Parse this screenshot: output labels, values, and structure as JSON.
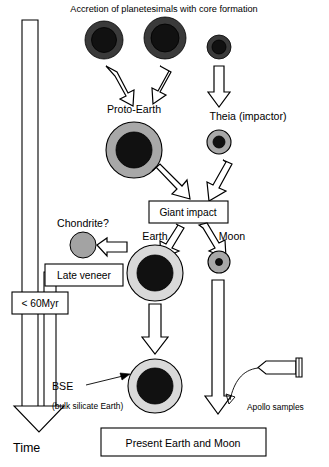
{
  "figure": {
    "title": "Accretion of planetesimals with core formation",
    "domain_note": "schematic of Earth-Moon formation"
  },
  "labels": {
    "proto_earth": "Proto-Earth",
    "theia": "Theia (impactor)",
    "giant_impact": "Giant impact",
    "chondrite": "Chondrite?",
    "late_veneer": "Late veneer",
    "earth": "Earth",
    "moon": "Moon",
    "timescale": "< 60Myr",
    "bse_abbr": "BSE",
    "bse_full": "(bulk silicate Earth)",
    "apollo": "Apollo samples",
    "time_axis": "Time",
    "present": "Present Earth and Moon"
  },
  "bodies": [
    {
      "name": "planetesimal-1",
      "cx": 104,
      "cy": 40,
      "shell_r": 19,
      "core_r": 12.5,
      "shell_color": "#3a3a3a",
      "core_color": "#111111"
    },
    {
      "name": "planetesimal-2",
      "cx": 165,
      "cy": 38,
      "shell_r": 21,
      "core_r": 14,
      "shell_color": "#3a3a3a",
      "core_color": "#111111"
    },
    {
      "name": "planetesimal-3",
      "cx": 219,
      "cy": 47,
      "shell_r": 12,
      "core_r": 7,
      "shell_color": "#3a3a3a",
      "core_color": "#111111"
    },
    {
      "name": "proto-earth",
      "cx": 134,
      "cy": 150,
      "shell_r": 28,
      "core_r": 18,
      "shell_color": "#a8a8a8",
      "core_color": "#111111"
    },
    {
      "name": "theia",
      "cx": 219,
      "cy": 142,
      "shell_r": 12,
      "core_r": 6,
      "shell_color": "#a8a8a8",
      "core_color": "#111111"
    },
    {
      "name": "chondrite",
      "cx": 83,
      "cy": 245,
      "shell_r": 13,
      "core_r": 0,
      "shell_color": "#a3a3a3",
      "core_color": "#a3a3a3"
    },
    {
      "name": "earth",
      "cx": 155,
      "cy": 273,
      "shell_r": 28,
      "core_r": 18,
      "shell_color": "#d9d9d9",
      "core_color": "#111111"
    },
    {
      "name": "moon",
      "cx": 219,
      "cy": 262,
      "shell_r": 11,
      "core_r": 3.5,
      "shell_color": "#a8a8a8",
      "core_color": "#111111"
    },
    {
      "name": "bse-earth",
      "cx": 155,
      "cy": 386,
      "shell_r": 27,
      "core_r": 18,
      "shell_color": "#d9d9d9",
      "core_color": "#111111"
    }
  ],
  "colors": {
    "outline": "#000000",
    "background": "#ffffff",
    "planetesimal_shell": "#3a3a3a",
    "core": "#111111",
    "proto_mantle": "#a8a8a8",
    "earth_mantle": "#d9d9d9",
    "chondrite_gray": "#a3a3a3"
  }
}
